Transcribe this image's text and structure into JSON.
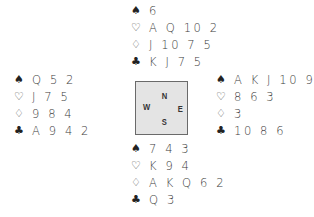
{
  "symbols": {
    "spades": "♠",
    "hearts": "♡",
    "diamonds": "♢",
    "clubs": "♣"
  },
  "icons": {
    "spades": "spade-icon",
    "hearts": "heart-outline-icon",
    "diamonds": "diamond-outline-icon",
    "clubs": "club-icon"
  },
  "compass": {
    "north": "N",
    "south": "S",
    "east": "E",
    "west": "W"
  },
  "hands": {
    "north": {
      "spades": "6",
      "hearts": "A Q 10 2",
      "diamonds": "J 10 7 5",
      "clubs": "K J 7 5"
    },
    "west": {
      "spades": "Q 5 2",
      "hearts": "J 7 5",
      "diamonds": "9 8 4",
      "clubs": "A 9 4 2"
    },
    "east": {
      "spades": "A K J 10 9 8",
      "hearts": "8 6 3",
      "diamonds": "3",
      "clubs": "10 8 6"
    },
    "south": {
      "spades": "7 4 3",
      "hearts": "K 9 4",
      "diamonds": "A K Q 6 2",
      "clubs": "Q 3"
    }
  }
}
